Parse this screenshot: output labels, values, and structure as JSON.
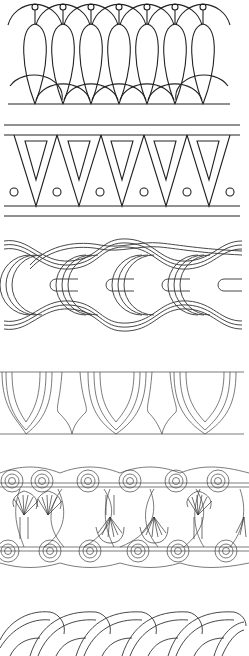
{
  "sheet": {
    "width": 249,
    "height": 656,
    "background": "#ffffff",
    "stroke_color": "#222222",
    "bands": [
      {
        "id": "band-1",
        "name": "Teardrop loop border",
        "top": 0,
        "height": 106,
        "repeat_count": 7
      },
      {
        "id": "band-2",
        "name": "Inverted triangle border with circles",
        "top": 122,
        "height": 92,
        "repeat_count": 5
      },
      {
        "id": "band-3",
        "name": "Interlaced triple-line guilloche",
        "top": 235,
        "height": 110,
        "repeat_count": 4
      },
      {
        "id": "band-4",
        "name": "Pointed arch / shield border",
        "top": 370,
        "height": 76,
        "repeat_count": 3
      },
      {
        "id": "band-5",
        "name": "Scroll and palmette frieze",
        "top": 460,
        "height": 115,
        "repeat_count": 3
      },
      {
        "id": "band-6",
        "name": "Twisted rope braid border",
        "top": 610,
        "height": 46,
        "repeat_count": 5
      }
    ]
  }
}
